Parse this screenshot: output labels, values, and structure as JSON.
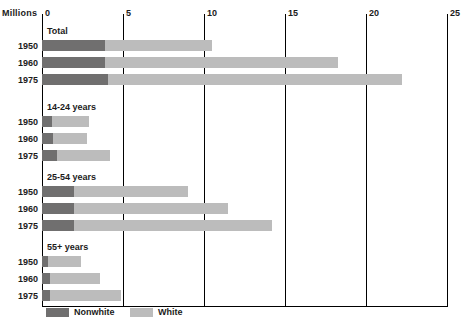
{
  "chart": {
    "unit_label": "Millions",
    "axis": {
      "ticks": [
        "0",
        "5",
        "10",
        "15",
        "20",
        "25"
      ],
      "tick_values": [
        0,
        5,
        10,
        15,
        20,
        25
      ]
    },
    "legend": [
      {
        "key": "nonwhite",
        "label": "Nonwhite",
        "color": "#706f6f"
      },
      {
        "key": "white",
        "label": "White",
        "color": "#bcbcbc"
      }
    ],
    "groups": [
      {
        "title": "Total",
        "rows": [
          {
            "year": "1950",
            "nonwhite": 3.9,
            "white": 6.6,
            "total": 10.5
          },
          {
            "year": "1960",
            "nonwhite": 3.9,
            "white": 14.4,
            "total": 18.3
          },
          {
            "year": "1975",
            "nonwhite": 4.1,
            "white": 18.1,
            "total": 22.2
          }
        ]
      },
      {
        "title": "14-24 years",
        "rows": [
          {
            "year": "1950",
            "nonwhite": 0.6,
            "white": 2.3,
            "total": 2.9
          },
          {
            "year": "1960",
            "nonwhite": 0.7,
            "white": 2.1,
            "total": 2.8
          },
          {
            "year": "1975",
            "nonwhite": 0.9,
            "white": 3.3,
            "total": 4.2
          }
        ]
      },
      {
        "title": "25-54 years",
        "rows": [
          {
            "year": "1950",
            "nonwhite": 2.0,
            "white": 7.0,
            "total": 9.0
          },
          {
            "year": "1960",
            "nonwhite": 2.0,
            "white": 9.5,
            "total": 11.5
          },
          {
            "year": "1975",
            "nonwhite": 2.0,
            "white": 12.2,
            "total": 14.2
          }
        ]
      },
      {
        "title": "55+ years",
        "rows": [
          {
            "year": "1950",
            "nonwhite": 0.4,
            "white": 2.0,
            "total": 2.4
          },
          {
            "year": "1960",
            "nonwhite": 0.5,
            "white": 3.1,
            "total": 3.6
          },
          {
            "year": "1975",
            "nonwhite": 0.5,
            "white": 4.4,
            "total": 4.9
          }
        ]
      }
    ]
  },
  "chart_data": {
    "type": "bar",
    "orientation": "horizontal",
    "stacked": true,
    "title": "",
    "xlabel": "Millions",
    "ylabel": "",
    "xlim": [
      0,
      25
    ],
    "xticks": [
      0,
      5,
      10,
      15,
      20,
      25
    ],
    "grid": true,
    "legend_position": "bottom-left",
    "series": [
      {
        "name": "Nonwhite",
        "color": "#706f6f",
        "values": [
          3.9,
          3.9,
          4.1,
          0.6,
          0.7,
          0.9,
          2.0,
          2.0,
          2.0,
          0.4,
          0.5,
          0.5
        ]
      },
      {
        "name": "White",
        "color": "#bcbcbc",
        "values": [
          6.6,
          14.4,
          18.1,
          2.3,
          2.1,
          3.3,
          7.0,
          9.5,
          12.2,
          2.0,
          3.1,
          4.4
        ]
      }
    ],
    "categories": [
      "Total 1950",
      "Total 1960",
      "Total 1975",
      "14-24 years 1950",
      "14-24 years 1960",
      "14-24 years 1975",
      "25-54 years 1950",
      "25-54 years 1960",
      "25-54 years 1975",
      "55+ years 1950",
      "55+ years 1960",
      "55+ years 1975"
    ],
    "group_labels": [
      "Total",
      "14-24 years",
      "25-54 years",
      "55+ years"
    ],
    "totals": [
      10.5,
      18.3,
      22.2,
      2.9,
      2.8,
      4.2,
      9.0,
      11.5,
      14.2,
      2.4,
      3.6,
      4.9
    ]
  }
}
